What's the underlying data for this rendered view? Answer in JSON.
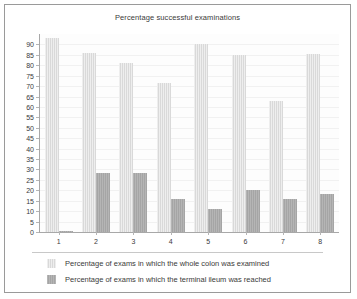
{
  "chart_data": {
    "type": "bar",
    "title": "Percentage successful examinations",
    "xlabel": "",
    "ylabel": "",
    "categories": [
      "1",
      "2",
      "3",
      "4",
      "5",
      "6",
      "7",
      "8"
    ],
    "series": [
      {
        "name": "Percentage of exams in which the whole colon was examined",
        "color": "#d9d9d9",
        "values": [
          93,
          86,
          81,
          71.5,
          90,
          85,
          63,
          85.5
        ]
      },
      {
        "name": "Percentage of exams in which the terminal ileum was reached",
        "color": "#a5a5a5",
        "values": [
          0.5,
          28.5,
          28.5,
          16,
          11,
          20,
          16,
          18
        ]
      }
    ],
    "ylim": [
      0,
      95
    ],
    "yticks": [
      0,
      5,
      10,
      15,
      20,
      25,
      30,
      35,
      40,
      45,
      50,
      55,
      60,
      65,
      70,
      75,
      80,
      85,
      90
    ],
    "ytick_labels": [
      "0",
      "5",
      "10",
      "15",
      "20",
      "25",
      "30",
      "35",
      "40",
      "45",
      "50",
      "55",
      "60",
      "65",
      "70",
      "75",
      "80",
      "85",
      "90"
    ],
    "grid": true,
    "legend_position": "bottom-left"
  },
  "legend": {
    "entries": [
      {
        "label": "Percentage of exams in which the whole colon was examined"
      },
      {
        "label": "Percentage of exams in which the terminal ileum was reached"
      }
    ]
  }
}
